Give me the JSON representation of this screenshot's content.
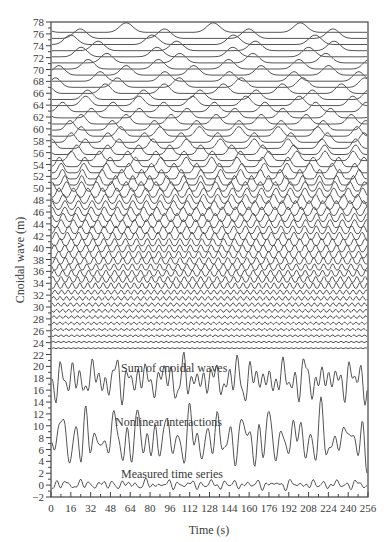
{
  "chart_data": {
    "type": "line",
    "title": "",
    "xlabel": "Time (s)",
    "ylabel": "Cnoidal wave (m)",
    "xlim": [
      0,
      256
    ],
    "ylim": [
      -2,
      78
    ],
    "grid": false,
    "legend": null,
    "x_ticks": [
      0,
      16,
      32,
      48,
      64,
      80,
      96,
      112,
      128,
      144,
      160,
      176,
      192,
      208,
      224,
      240,
      256
    ],
    "y_ticks": [
      -2,
      0,
      2,
      4,
      6,
      8,
      10,
      12,
      14,
      16,
      18,
      20,
      22,
      24,
      26,
      28,
      30,
      32,
      34,
      36,
      38,
      40,
      42,
      44,
      46,
      48,
      50,
      52,
      54,
      56,
      58,
      60,
      62,
      64,
      66,
      68,
      70,
      72,
      74,
      76,
      78
    ],
    "annotations": [
      {
        "text": "Sum of cnoidal waves",
        "x": 120,
        "y": 21
      },
      {
        "text": "Nonlinear interactions",
        "x": 110,
        "y": 12
      },
      {
        "text": "Measured time series",
        "x": 110,
        "y": 2.6
      }
    ],
    "series": [
      {
        "name": "Measured time series",
        "baseline": 0,
        "amplitude_range": [
          -1,
          1.2
        ]
      },
      {
        "name": "Nonlinear interactions",
        "baseline": 8,
        "amplitude_range": [
          2.2,
          12.3
        ]
      },
      {
        "name": "Sum of cnoidal waves",
        "baseline": 18,
        "amplitude_range": [
          12.8,
          22.3
        ]
      },
      {
        "name": "Cnoidal wave components",
        "count": 53,
        "baseline_start": 23.0,
        "baseline_end": 76.5,
        "note": "stacked offset traces; low-amplitude near-flat traces from ~23 to ~32, sinusoidal-like from ~33 to ~50, peaked cnoidal shapes with increasing period from ~50 to ~76"
      }
    ]
  },
  "labels": {
    "xlabel": "Time (s)",
    "ylabel": "Cnoidal wave (m)",
    "sum": "Sum of cnoidal waves",
    "nonlinear": "Nonlinear interactions",
    "measured": "Measured time series"
  }
}
